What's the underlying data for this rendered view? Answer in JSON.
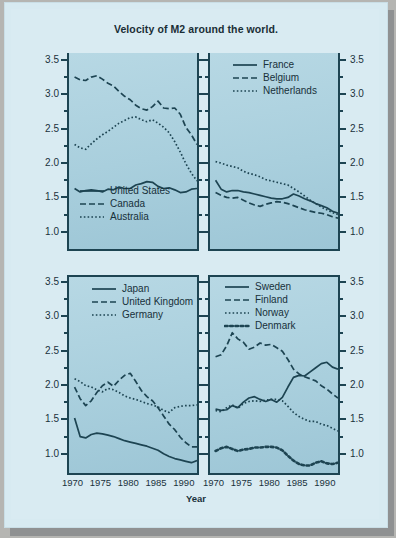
{
  "card": {
    "title": "Velocity of M2 around the world.",
    "xaxis_title": "Year",
    "background": "#d9ebf2",
    "panel_fill": "#aed2e0",
    "ink": "#1d4452"
  },
  "axes": {
    "y_ticks_major": [
      "3.5",
      "3.0",
      "2.5",
      "2.0",
      "1.5",
      "1.0"
    ],
    "y_values_major": [
      3.5,
      3.0,
      2.5,
      2.0,
      1.5,
      1.0
    ],
    "y_minor_step": 0.25,
    "ylim": [
      0.75,
      3.6
    ],
    "x_ticks": [
      "1970",
      "1975",
      "1980",
      "1985",
      "1990"
    ],
    "x_values": [
      1970,
      1975,
      1980,
      1985,
      1990
    ],
    "xlim": [
      1969,
      1992
    ]
  },
  "chart_data": {
    "type": "line",
    "title": "Velocity of M2 around the world.",
    "xlabel": "Year",
    "ylabel": "",
    "xlim": [
      1969,
      1992
    ],
    "ylim": [
      0.75,
      3.6
    ],
    "grid": false,
    "legend_position": "inside-panel",
    "panel_layout": "2x2",
    "x": [
      1970,
      1971,
      1972,
      1973,
      1974,
      1975,
      1976,
      1977,
      1978,
      1979,
      1980,
      1981,
      1982,
      1983,
      1984,
      1985,
      1986,
      1987,
      1988,
      1989,
      1990,
      1991,
      1992
    ],
    "panels": [
      {
        "id": "panel-north-america-australia",
        "position": "top-left",
        "legend": [
          "United States",
          "Canada",
          "Australia"
        ],
        "series": [
          {
            "name": "United States",
            "style": "solid",
            "values": [
              1.63,
              1.58,
              1.6,
              1.61,
              1.6,
              1.58,
              1.62,
              1.61,
              1.65,
              1.63,
              1.63,
              1.68,
              1.7,
              1.73,
              1.72,
              1.66,
              1.63,
              1.64,
              1.61,
              1.57,
              1.58,
              1.62,
              1.63,
              1.66,
              1.72
            ]
          },
          {
            "name": "Canada",
            "style": "dashed",
            "values": [
              3.25,
              3.21,
              3.2,
              3.25,
              3.27,
              3.22,
              3.16,
              3.12,
              3.04,
              2.97,
              2.92,
              2.84,
              2.79,
              2.77,
              2.82,
              2.9,
              2.8,
              2.79,
              2.8,
              2.71,
              2.52,
              2.41,
              2.27
            ]
          },
          {
            "name": "Australia",
            "style": "dotted",
            "values": [
              2.27,
              2.22,
              2.2,
              2.28,
              2.35,
              2.41,
              2.46,
              2.52,
              2.58,
              2.62,
              2.66,
              2.67,
              2.63,
              2.6,
              2.63,
              2.58,
              2.52,
              2.44,
              2.31,
              2.16,
              1.99,
              1.85,
              1.74
            ]
          }
        ]
      },
      {
        "id": "panel-western-europe",
        "position": "top-right",
        "legend": [
          "France",
          "Belgium",
          "Netherlands"
        ],
        "series": [
          {
            "name": "France",
            "style": "solid",
            "values": [
              1.75,
              1.62,
              1.58,
              1.6,
              1.6,
              1.58,
              1.57,
              1.55,
              1.53,
              1.51,
              1.49,
              1.48,
              1.48,
              1.5,
              1.55,
              1.52,
              1.48,
              1.45,
              1.41,
              1.38,
              1.35,
              1.3,
              1.27
            ]
          },
          {
            "name": "Belgium",
            "style": "dashed",
            "values": [
              1.57,
              1.53,
              1.5,
              1.49,
              1.5,
              1.46,
              1.42,
              1.39,
              1.37,
              1.4,
              1.42,
              1.44,
              1.43,
              1.41,
              1.38,
              1.35,
              1.32,
              1.3,
              1.28,
              1.27,
              1.25,
              1.22,
              1.2
            ]
          },
          {
            "name": "Netherlands",
            "style": "dotted",
            "values": [
              2.02,
              2.0,
              1.97,
              1.95,
              1.93,
              1.88,
              1.85,
              1.83,
              1.8,
              1.76,
              1.74,
              1.72,
              1.7,
              1.68,
              1.63,
              1.58,
              1.52,
              1.46,
              1.41,
              1.36,
              1.32,
              1.28,
              1.25
            ]
          }
        ]
      },
      {
        "id": "panel-japan-uk-germany",
        "position": "bottom-left",
        "legend": [
          "Japan",
          "United Kingdom",
          "Germany"
        ],
        "series": [
          {
            "name": "Japan",
            "style": "solid",
            "values": [
              1.55,
              1.28,
              1.26,
              1.31,
              1.33,
              1.32,
              1.3,
              1.28,
              1.25,
              1.22,
              1.2,
              1.18,
              1.16,
              1.14,
              1.11,
              1.08,
              1.03,
              0.99,
              0.96,
              0.94,
              0.92,
              0.9,
              0.93
            ]
          },
          {
            "name": "United Kingdom",
            "style": "dashed",
            "values": [
              2.0,
              1.83,
              1.73,
              1.8,
              1.92,
              2.02,
              2.07,
              2.01,
              2.1,
              2.17,
              2.2,
              2.08,
              1.95,
              1.86,
              1.8,
              1.7,
              1.58,
              1.46,
              1.38,
              1.27,
              1.19,
              1.13,
              1.13
            ]
          },
          {
            "name": "Germany",
            "style": "dotted",
            "values": [
              2.12,
              2.08,
              2.02,
              2.0,
              1.96,
              1.93,
              1.98,
              1.96,
              1.92,
              1.87,
              1.84,
              1.82,
              1.79,
              1.76,
              1.74,
              1.71,
              1.66,
              1.63,
              1.7,
              1.72,
              1.73,
              1.73,
              1.74
            ]
          }
        ]
      },
      {
        "id": "panel-nordics",
        "position": "bottom-right",
        "legend": [
          "Sweden",
          "Finland",
          "Norway",
          "Denmark"
        ],
        "series": [
          {
            "name": "Sweden",
            "style": "solid",
            "values": [
              1.68,
              1.66,
              1.67,
              1.73,
              1.7,
              1.78,
              1.84,
              1.86,
              1.82,
              1.79,
              1.82,
              1.78,
              1.85,
              2.0,
              2.14,
              2.17,
              2.16,
              2.22,
              2.28,
              2.34,
              2.36,
              2.29,
              2.26
            ]
          },
          {
            "name": "Finland",
            "style": "dashed",
            "values": [
              2.44,
              2.47,
              2.6,
              2.79,
              2.7,
              2.65,
              2.55,
              2.58,
              2.64,
              2.61,
              2.62,
              2.57,
              2.52,
              2.4,
              2.26,
              2.19,
              2.15,
              2.12,
              2.09,
              2.02,
              1.97,
              1.9,
              1.84
            ]
          },
          {
            "name": "Norway",
            "style": "dotted",
            "values": [
              1.66,
              1.64,
              1.7,
              1.74,
              1.69,
              1.76,
              1.79,
              1.8,
              1.79,
              1.81,
              1.82,
              1.82,
              1.8,
              1.72,
              1.63,
              1.57,
              1.53,
              1.5,
              1.5,
              1.46,
              1.44,
              1.4,
              1.36
            ]
          },
          {
            "name": "Denmark",
            "style": "thick-dotted",
            "values": [
              1.07,
              1.11,
              1.13,
              1.1,
              1.07,
              1.09,
              1.1,
              1.12,
              1.12,
              1.13,
              1.13,
              1.12,
              1.08,
              1.0,
              0.93,
              0.88,
              0.86,
              0.86,
              0.9,
              0.92,
              0.89,
              0.88,
              0.9
            ]
          }
        ]
      }
    ]
  }
}
